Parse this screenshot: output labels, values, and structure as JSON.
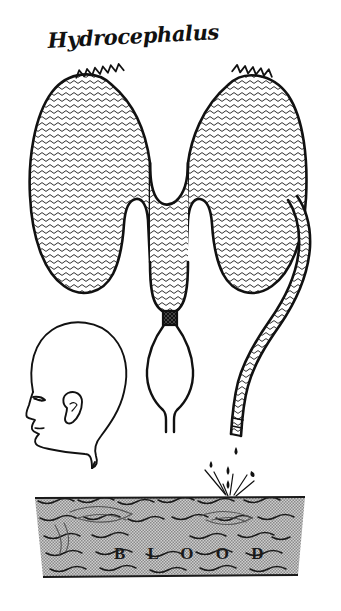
{
  "figure": {
    "title": "Hydrocephalus",
    "background_color": "#ffffff",
    "ink_color": "#111111",
    "fill_texture_color": "#3a3a3a",
    "blood_pool_color": "#a8a8a8",
    "caption_in_pool": "B L O O D"
  },
  "labels": {
    "title": "Hydrocephalus",
    "blood": "B L O O D"
  },
  "parts": [
    {
      "name": "left-lateral-ventricle",
      "label": "Left lateral ventricle",
      "fill": "wavy-hatch",
      "has_choroid_plexus_crest": true
    },
    {
      "name": "right-lateral-ventricle",
      "label": "Right lateral ventricle",
      "fill": "wavy-hatch",
      "has_choroid_plexus_crest": true
    },
    {
      "name": "third-ventricle",
      "label": "Third ventricle",
      "fill": "wavy-hatch",
      "has_choroid_plexus_crest": false
    },
    {
      "name": "cerebral-aqueduct-stenosis",
      "label": "Obstructed cerebral aqueduct",
      "fill": "solid-dark",
      "has_choroid_plexus_crest": false
    },
    {
      "name": "fourth-ventricle",
      "label": "Fourth ventricle",
      "fill": "none",
      "has_choroid_plexus_crest": false
    },
    {
      "name": "shunt-catheter",
      "label": "Shunt catheter",
      "fill": "wavy-hatch",
      "has_choroid_plexus_crest": false
    },
    {
      "name": "infant-head-profile",
      "label": "Infant head profile with enlarged cranium",
      "fill": "none",
      "has_choroid_plexus_crest": false
    },
    {
      "name": "blood-pool",
      "label": "Blood",
      "fill": "halftone-gray",
      "has_choroid_plexus_crest": false
    }
  ],
  "droplets": {
    "count": 5,
    "description": "Cerebrospinal fluid dripping from catheter tip into blood"
  }
}
